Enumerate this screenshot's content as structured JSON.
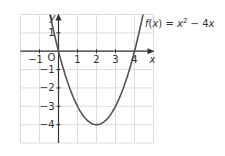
{
  "chart_data": {
    "type": "line",
    "title": "",
    "function_label": "f(x) = x² − 4x",
    "function_label_parts": {
      "f": "f",
      "open": "(",
      "x": "x",
      "close": ")",
      "eq": " = ",
      "x2": "x",
      "exp": "2",
      "minus": " − 4",
      "x3": "x"
    },
    "xlabel": "x",
    "ylabel": "y",
    "origin_label": "O",
    "xlim": [
      -2,
      5
    ],
    "ylim": [
      -5,
      2
    ],
    "grid": true,
    "x_ticks": [
      -1,
      1,
      2,
      3,
      4
    ],
    "x_tick_labels": [
      "−1",
      "1",
      "2",
      "3",
      "4"
    ],
    "y_ticks": [
      1,
      -1,
      -2,
      -3,
      -4
    ],
    "y_tick_labels": [
      "1",
      "−1",
      "−2",
      "−3",
      "−4"
    ],
    "series": [
      {
        "name": "f(x) = x^2 - 4x",
        "x": [
          -0.45,
          0,
          0.5,
          1,
          1.5,
          2,
          2.5,
          3,
          3.5,
          4,
          4.45
        ],
        "y": [
          2.0,
          0,
          -1.75,
          -3,
          -3.75,
          -4,
          -3.75,
          -3,
          -1.75,
          0,
          2.0
        ]
      }
    ],
    "vertex": [
      2,
      -4
    ],
    "roots": [
      0,
      4
    ]
  },
  "colors": {
    "curve": "#555555",
    "axes": "#333333",
    "grid": "#dcdcdc",
    "text": "#333333"
  }
}
